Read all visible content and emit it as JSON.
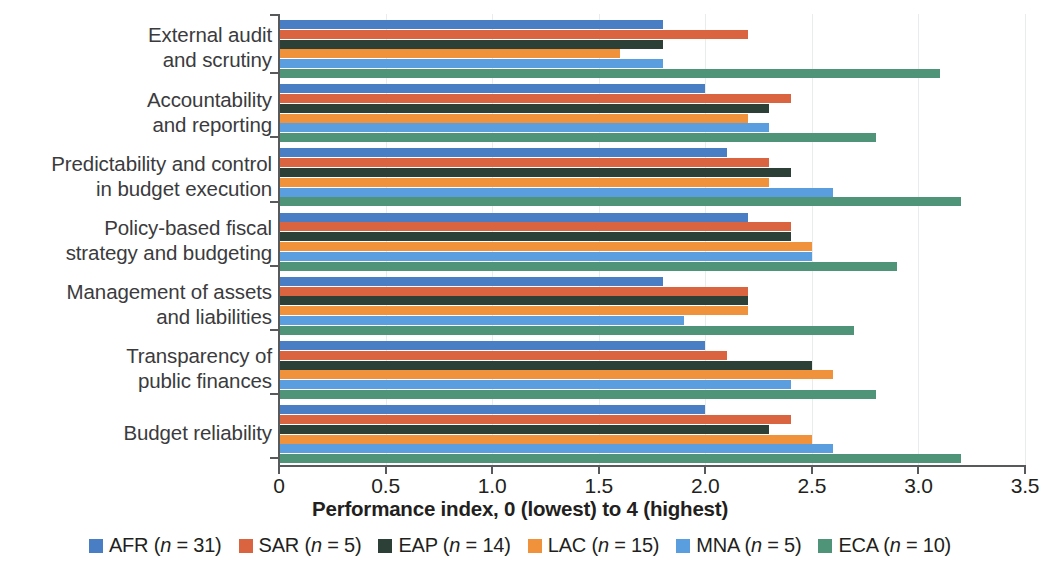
{
  "chart_data": {
    "type": "bar",
    "orientation": "horizontal",
    "title": "",
    "xlabel": "Performance index, 0 (lowest) to 4 (highest)",
    "ylabel": "",
    "xlim": [
      0,
      3.5
    ],
    "xticks": [
      "0",
      "0.5",
      "1.0",
      "1.5",
      "2.0",
      "2.5",
      "3.0",
      "3.5"
    ],
    "xtick_values": [
      0,
      0.5,
      1.0,
      1.5,
      2.0,
      2.5,
      3.0,
      3.5
    ],
    "grid": "vertical",
    "legend_position": "bottom",
    "categories": [
      "External audit\nand scrutiny",
      "Accountability\nand reporting",
      "Predictability and control\nin budget execution",
      "Policy-based fiscal\nstrategy and budgeting",
      "Management of assets\nand liabilities",
      "Transparency of\npublic finances",
      "Budget reliability"
    ],
    "series": [
      {
        "name": "AFR",
        "n": 31,
        "legend_label": "AFR (n = 31)",
        "color": "#4a7ec4",
        "values": [
          1.8,
          2.0,
          2.1,
          2.2,
          1.8,
          2.0,
          2.0
        ]
      },
      {
        "name": "SAR",
        "n": 5,
        "legend_label": "SAR (n = 5)",
        "color": "#d9643f",
        "values": [
          2.2,
          2.4,
          2.3,
          2.4,
          2.2,
          2.1,
          2.4
        ]
      },
      {
        "name": "EAP",
        "n": 14,
        "legend_label": "EAP (n = 14)",
        "color": "#2c4037",
        "values": [
          1.8,
          2.3,
          2.4,
          2.4,
          2.2,
          2.5,
          2.3
        ]
      },
      {
        "name": "LAC",
        "n": 15,
        "legend_label": "LAC (n = 15)",
        "color": "#f0913c",
        "values": [
          1.6,
          2.2,
          2.3,
          2.5,
          2.2,
          2.6,
          2.5
        ]
      },
      {
        "name": "MNA",
        "n": 5,
        "legend_label": "MNA (n = 5)",
        "color": "#5a9ee0",
        "values": [
          1.8,
          2.3,
          2.6,
          2.5,
          1.9,
          2.4,
          2.6
        ]
      },
      {
        "name": "ECA",
        "n": 10,
        "legend_label": "ECA (n = 10)",
        "color": "#4f9478",
        "values": [
          3.1,
          2.8,
          3.2,
          2.9,
          2.7,
          2.8,
          3.2
        ]
      }
    ]
  }
}
